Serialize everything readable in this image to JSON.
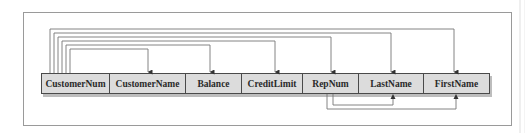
{
  "diagram": {
    "type": "dependency-diagram",
    "colors": {
      "box_fill": "#dcdcdc",
      "box_border": "#4a4a4a",
      "line": "#777777",
      "frame": "#9a9a9a"
    },
    "fields": [
      {
        "label": "CustomerNum",
        "x": 41,
        "w": 69
      },
      {
        "label": "CustomerName",
        "x": 110,
        "w": 76
      },
      {
        "label": "Balance",
        "x": 186,
        "w": 56
      },
      {
        "label": "CreditLimit",
        "x": 242,
        "w": 61
      },
      {
        "label": "RepNum",
        "x": 303,
        "w": 56
      },
      {
        "label": "LastName",
        "x": 359,
        "w": 65
      },
      {
        "label": "FirstName",
        "x": 424,
        "w": 66
      }
    ],
    "dependencies_above": [
      {
        "from": "CustomerNum",
        "to": "FirstName",
        "fx": 50,
        "y": 29,
        "tx": 454
      },
      {
        "from": "CustomerNum",
        "to": "LastName",
        "fx": 54,
        "y": 33,
        "tx": 391
      },
      {
        "from": "CustomerNum",
        "to": "RepNum",
        "fx": 58,
        "y": 37,
        "tx": 331
      },
      {
        "from": "CustomerNum",
        "to": "CreditLimit",
        "fx": 62,
        "y": 41,
        "tx": 275
      },
      {
        "from": "CustomerNum",
        "to": "Balance",
        "fx": 66,
        "y": 45,
        "tx": 210
      },
      {
        "from": "CustomerNum",
        "to": "CustomerName",
        "fx": 70,
        "y": 49,
        "tx": 148
      }
    ],
    "dependencies_below": [
      {
        "from": "RepNum",
        "to": "FirstName",
        "fx": 327,
        "y": 109,
        "tx": 456
      },
      {
        "from": "RepNum",
        "to": "LastName",
        "fx": 333,
        "y": 105,
        "tx": 393
      }
    ]
  }
}
